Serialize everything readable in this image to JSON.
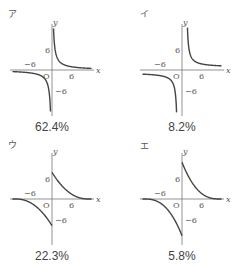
{
  "figure": {
    "panels": [
      {
        "id": "a",
        "label": "ア",
        "percent": "62.4%",
        "ox": 52,
        "oy": 70,
        "lx": 8,
        "ly": 17,
        "shape": "reciprocal-positive",
        "tick_pos_y": "6",
        "tick_neg_x": "−6",
        "tick_pos_x": "6",
        "tick_neg_y": "−6",
        "axis_x": "x",
        "axis_y": "y",
        "origin": "O"
      },
      {
        "id": "i",
        "label": "イ",
        "percent": "8.2%",
        "ox": 182,
        "oy": 70,
        "lx": 140,
        "ly": 17,
        "shape": "reciprocal-shifted",
        "tick_pos_y": "6",
        "tick_neg_x": "−6",
        "tick_pos_x": "6",
        "tick_neg_y": "−6",
        "axis_x": "x",
        "axis_y": "y",
        "origin": "O"
      },
      {
        "id": "u",
        "label": "ウ",
        "percent": "22.3%",
        "ox": 52,
        "oy": 199,
        "lx": 8,
        "ly": 148,
        "shape": "decay-intercept",
        "tick_pos_y": "6",
        "tick_neg_x": "−6",
        "tick_pos_x": "6",
        "tick_neg_y": "−6",
        "axis_x": "x",
        "axis_y": "y",
        "origin": "O"
      },
      {
        "id": "e",
        "label": "エ",
        "percent": "5.8%",
        "ox": 182,
        "oy": 199,
        "lx": 140,
        "ly": 149,
        "shape": "decay-intercept-steep",
        "tick_pos_y": "6",
        "tick_neg_x": "−6",
        "tick_pos_x": "6",
        "tick_neg_y": "−6",
        "axis_x": "x",
        "axis_y": "y",
        "origin": "O"
      }
    ]
  },
  "chart_data": {
    "type": "line",
    "title": "",
    "panels": [
      {
        "label": "ア",
        "percent": 62.4,
        "curve": "y = 6/x style hyperbola in quadrants I and III, asymptotic to both axes"
      },
      {
        "label": "イ",
        "percent": 8.2,
        "curve": "hyperbola shifted right (vertical asymptote near x≈1), branches in quadrants I and III"
      },
      {
        "label": "ウ",
        "percent": 22.3,
        "curve": "curves meeting y-axis near y=±8, decaying to x-axis (finite intercepts)"
      },
      {
        "label": "エ",
        "percent": 5.8,
        "curve": "curves meeting y-axis near y=±10, decaying to x-axis, reaching x-axis near x≈8"
      }
    ],
    "xlabel": "x",
    "ylabel": "y",
    "xticks": [
      "−6",
      "6"
    ],
    "yticks": [
      "6",
      "−6"
    ],
    "percentages": [
      62.4,
      8.2,
      22.3,
      5.8
    ]
  }
}
